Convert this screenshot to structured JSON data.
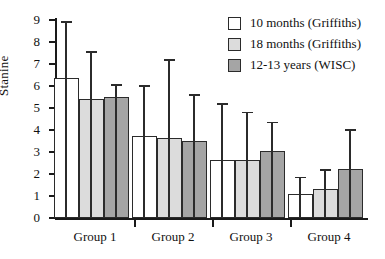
{
  "chart_data": {
    "type": "bar",
    "title": "",
    "xlabel": "",
    "ylabel": "Stanine",
    "categories": [
      "Group 1",
      "Group 2",
      "Group 3",
      "Group 4"
    ],
    "ylim": [
      0,
      9
    ],
    "yticks": [
      0,
      1,
      2,
      3,
      4,
      5,
      6,
      7,
      8,
      9
    ],
    "grid": false,
    "legend_position": "top-right",
    "errorbars": "upper-only",
    "series": [
      {
        "name": "10 months (Griffiths)",
        "color": "#ffffff",
        "values": [
          6.35,
          3.75,
          2.65,
          1.1
        ],
        "error_upper": [
          8.9,
          6.0,
          5.2,
          1.85
        ]
      },
      {
        "name": "18 months (Griffiths)",
        "color": "#dcdcdc",
        "values": [
          5.4,
          3.65,
          2.65,
          1.3
        ],
        "error_upper": [
          7.55,
          7.2,
          4.8,
          2.2
        ]
      },
      {
        "name": "12-13 years (WISC)",
        "color": "#a5a5a5",
        "values": [
          5.5,
          3.5,
          3.05,
          2.25
        ],
        "error_upper": [
          6.05,
          5.6,
          4.35,
          4.0
        ]
      }
    ]
  },
  "axis": {
    "y_label": "Stanine",
    "y_tick_labels": [
      "0",
      "1",
      "2",
      "3",
      "4",
      "5",
      "6",
      "7",
      "8",
      "9"
    ]
  },
  "legend": {
    "items": [
      {
        "label": "10 months (Griffiths)",
        "swatch": "legend-swatch-white"
      },
      {
        "label": "18 months (Griffiths)",
        "swatch": "legend-swatch-light-gray"
      },
      {
        "label": "12-13 years (WISC)",
        "swatch": "legend-swatch-dark-gray"
      }
    ]
  },
  "colors": {
    "series_0": "#ffffff",
    "series_1": "#dcdcdc",
    "series_2": "#a5a5a5",
    "axis": "#1a1a1a",
    "outline": "#2b2b2b",
    "background": "#ffffff"
  }
}
